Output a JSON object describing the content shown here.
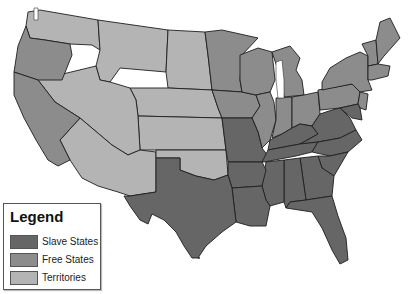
{
  "map": {
    "subject": "United States - Slave States, Free States and Territories",
    "colors": {
      "slave": "#666666",
      "free": "#8c8c8c",
      "territory": "#b4b4b4",
      "border": "#1e1e1e",
      "water": "#ffffff"
    }
  },
  "legend": {
    "title": "Legend",
    "items": [
      {
        "label": "Slave States",
        "color": "#666666"
      },
      {
        "label": "Free States",
        "color": "#8c8c8c"
      },
      {
        "label": "Territories",
        "color": "#b4b4b4"
      }
    ]
  }
}
